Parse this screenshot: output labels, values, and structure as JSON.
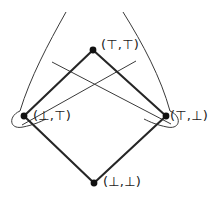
{
  "figure": {
    "kind": "lattice-hasse-diagram",
    "width": 221,
    "height": 197,
    "background_color": "#ffffff",
    "line_color": "#262626",
    "thin_line_color": "#3a3a3a",
    "node_color": "#111111"
  },
  "nodes": [
    {
      "id": "top-top",
      "label": "(⊤,⊤)",
      "x": 93,
      "y": 50,
      "label_x": 101,
      "label_y": 38
    },
    {
      "id": "bot-top",
      "label": "(⊥,⊤)",
      "x": 24,
      "y": 116,
      "label_x": 33,
      "label_y": 110
    },
    {
      "id": "top-bot",
      "label": "(⊤,⊥)",
      "x": 166,
      "y": 116,
      "label_x": 170,
      "label_y": 110
    },
    {
      "id": "bot-bot",
      "label": "(⊥,⊥)",
      "x": 94,
      "y": 183,
      "label_x": 103,
      "label_y": 176
    }
  ],
  "edges": [
    {
      "id": "edge-botbot-bottop",
      "from": "bot-bot",
      "to": "bot-top"
    },
    {
      "id": "edge-botbot-topbot",
      "from": "bot-bot",
      "to": "top-bot"
    },
    {
      "id": "edge-bottop-toptop",
      "from": "bot-top",
      "to": "top-top"
    },
    {
      "id": "edge-topbot-toptop",
      "from": "top-bot",
      "to": "top-top"
    }
  ],
  "overlay": {
    "description": "thin crossing arcs and side loops",
    "cross_line_left": {
      "x1": 52,
      "y1": 62,
      "x2": 172,
      "y2": 125
    },
    "cross_line_right": {
      "x1": 138,
      "y1": 62,
      "x2": 22,
      "y2": 126
    },
    "long_arc_left": {
      "x1": 66,
      "y1": 12,
      "x2": 20,
      "y2": 112
    },
    "long_arc_right": {
      "x1": 122,
      "y1": 12,
      "x2": 170,
      "y2": 112
    },
    "loop_left": {
      "cx": 20,
      "cy": 119
    },
    "loop_right": {
      "cx": 170,
      "cy": 119
    }
  }
}
